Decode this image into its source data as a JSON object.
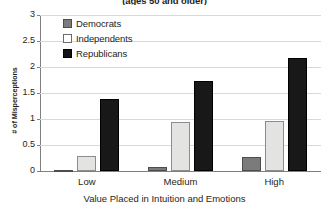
{
  "chart_data": {
    "type": "bar",
    "title": "(ages 50 and older)",
    "xlabel": "Value Placed in Intuition and Emotions",
    "ylabel": "# of  Misperceptions",
    "categories": [
      "Low",
      "Medium",
      "High"
    ],
    "series": [
      {
        "name": "Democrats",
        "color": "#7b7b7b",
        "values": [
          0.02,
          0.08,
          0.27
        ]
      },
      {
        "name": "Independents",
        "color": "#e3e3e1",
        "values": [
          0.29,
          0.95,
          0.96
        ]
      },
      {
        "name": "Republicans",
        "color": "#181818",
        "values": [
          1.38,
          1.73,
          2.17
        ]
      }
    ],
    "ylim": [
      0,
      3
    ],
    "yticks": [
      "0",
      "0.5",
      "1",
      "1.5",
      "2",
      "2.5",
      "3"
    ],
    "ytick_values": [
      0,
      0.5,
      1,
      1.5,
      2,
      2.5,
      3
    ],
    "grid": true,
    "legend_position": "top-left"
  }
}
